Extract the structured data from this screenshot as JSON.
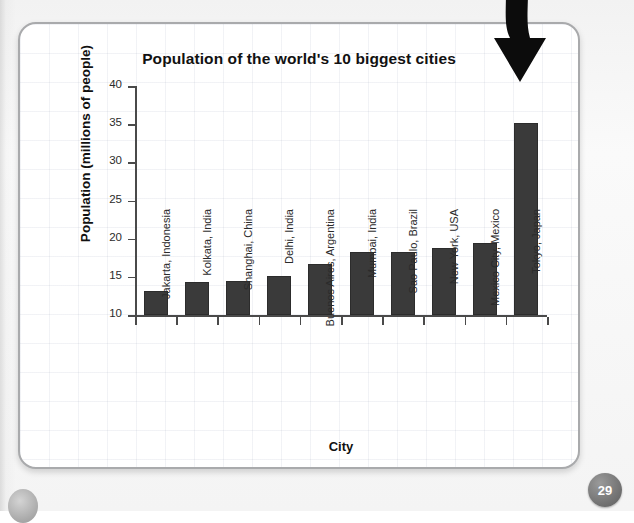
{
  "page": {
    "page_number": "29",
    "decoration": "curved-down-arrow"
  },
  "chart_data": {
    "type": "bar",
    "title": "Population of the world's 10 biggest cities",
    "xlabel": "City",
    "ylabel": "Population (millions of people)",
    "ylim": [
      10,
      40
    ],
    "yticks": [
      "10",
      "15",
      "20",
      "25",
      "30",
      "35",
      "40"
    ],
    "grid": false,
    "legend": "none",
    "bar_color": "#3a3a3a",
    "categories": [
      "Jakarta, Indonesia",
      "Kolkata, India",
      "Shanghai, China",
      "Delhi, India",
      "Buenos Aires, Argentina",
      "Mumbai, India",
      "Sao Paulo, Brazil",
      "New York, USA",
      "Mexico City, Mexico",
      "Tokyo, Japan"
    ],
    "values": [
      13.2,
      14.3,
      14.5,
      15.1,
      16.7,
      18.2,
      18.3,
      18.8,
      19.4,
      35.2
    ]
  }
}
